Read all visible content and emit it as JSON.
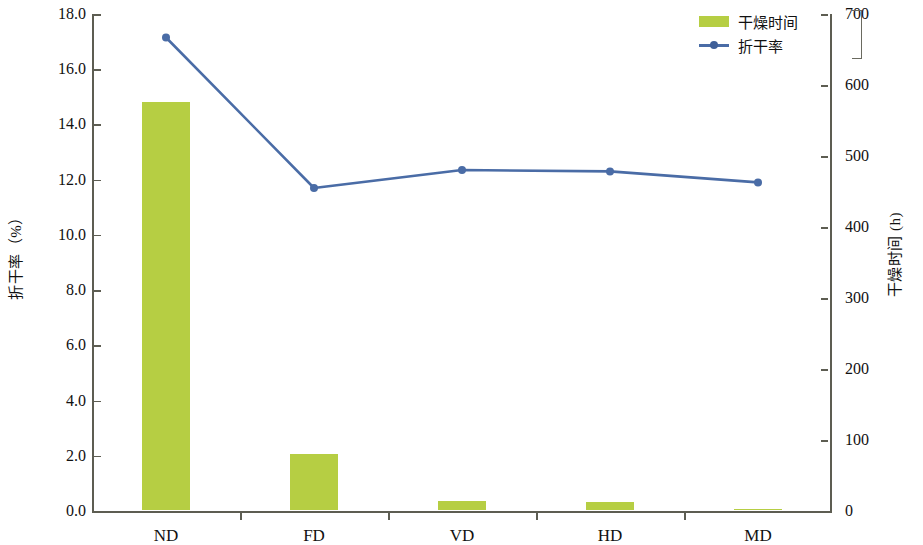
{
  "chart_data": {
    "type": "bar",
    "title": "",
    "categories": [
      "ND",
      "FD",
      "VD",
      "HD",
      "MD"
    ],
    "xlabel": "",
    "grid": false,
    "legend_position": "top-right",
    "series": [
      {
        "name": "干燥时间",
        "type": "bar",
        "axis": "right",
        "unit": "h",
        "values": [
          575,
          79,
          13,
          11,
          2
        ],
        "color": "#b6ce43"
      },
      {
        "name": "折干率",
        "type": "line",
        "axis": "left",
        "unit": "%",
        "values": [
          17.15,
          11.7,
          12.35,
          12.3,
          11.9
        ],
        "color": "#4a6ca6"
      }
    ],
    "axes": {
      "left": {
        "label": "折干率（%）",
        "ylim": [
          0.0,
          18.0
        ],
        "tick_step": 2.0,
        "ticks": [
          "0.0",
          "2.0",
          "4.0",
          "6.0",
          "8.0",
          "10.0",
          "12.0",
          "14.0",
          "16.0",
          "18.0"
        ]
      },
      "right": {
        "label": "干燥时间 (h)",
        "ylim": [
          0,
          700
        ],
        "tick_step": 100,
        "ticks": [
          "0",
          "100",
          "200",
          "300",
          "400",
          "500",
          "600",
          "700"
        ]
      }
    }
  },
  "legend": {
    "items": [
      {
        "label": "干燥时间",
        "marker": "bar-swatch"
      },
      {
        "label": "折干率",
        "marker": "line-marker"
      }
    ]
  }
}
